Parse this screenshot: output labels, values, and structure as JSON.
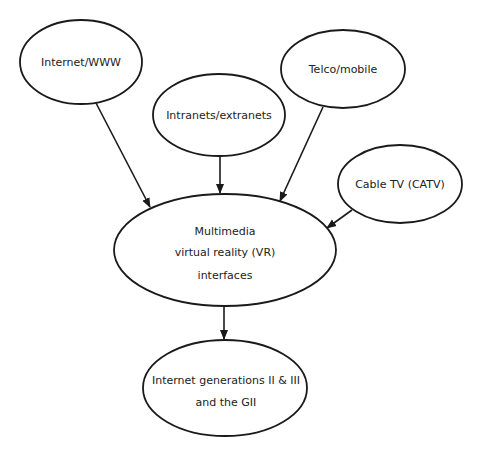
{
  "diagram": {
    "type": "flow",
    "colors": {
      "stroke": "#1a1a1a",
      "text": "#222222",
      "background": "#ffffff"
    },
    "nodes": {
      "internet_www": {
        "lines": [
          "Internet/WWW"
        ]
      },
      "intranets": {
        "lines": [
          "Intranets/extranets"
        ]
      },
      "telco": {
        "lines": [
          "Telco/mobile"
        ]
      },
      "cable": {
        "lines": [
          "Cable TV (CATV)"
        ]
      },
      "multimedia": {
        "lines": [
          "Multimedia",
          "virtual reality (VR)",
          "interfaces"
        ]
      },
      "internet_gen": {
        "lines": [
          "Internet generations II & III",
          "and the GII"
        ]
      }
    },
    "edges": [
      {
        "from": "Internet/WWW",
        "to": "Multimedia virtual reality (VR) interfaces"
      },
      {
        "from": "Intranets/extranets",
        "to": "Multimedia virtual reality (VR) interfaces"
      },
      {
        "from": "Telco/mobile",
        "to": "Multimedia virtual reality (VR) interfaces"
      },
      {
        "from": "Cable TV (CATV)",
        "to": "Multimedia virtual reality (VR) interfaces"
      },
      {
        "from": "Multimedia virtual reality (VR) interfaces",
        "to": "Internet generations II & III and the GII"
      }
    ]
  }
}
